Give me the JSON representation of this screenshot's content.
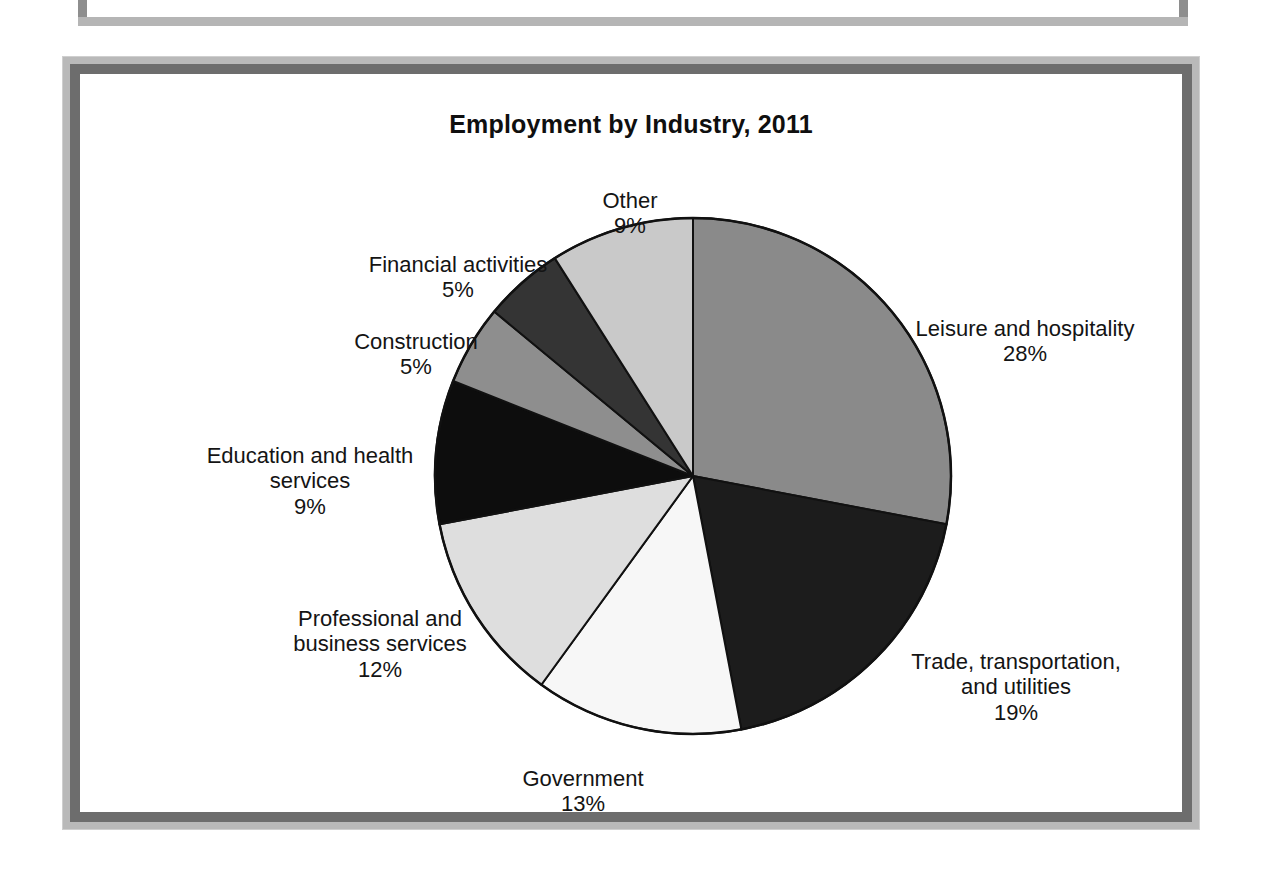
{
  "figure": {
    "title": "Employment by Industry, 2011"
  },
  "chart_data": {
    "type": "pie",
    "title": "Employment by Industry, 2011",
    "xlabel": "",
    "ylabel": "",
    "legend_position": "none",
    "grid": false,
    "value_unit": "percent",
    "start_angle_deg": 0,
    "direction": "clockwise",
    "categories": [
      "Leisure and hospitality",
      "Trade, transportation, and utilities",
      "Government",
      "Professional and business services",
      "Education and health services",
      "Construction",
      "Financial activities",
      "Other"
    ],
    "values": [
      28,
      19,
      13,
      12,
      9,
      5,
      5,
      9
    ],
    "slice_colors": [
      "#8a8a8a",
      "#1c1c1c",
      "#f7f7f7",
      "#dedede",
      "#0d0d0d",
      "#8e8e8e",
      "#343434",
      "#c9c9c9"
    ],
    "slices": [
      {
        "label": "Leisure and hospitality",
        "value": 28,
        "value_label": "28%",
        "color": "#8a8a8a"
      },
      {
        "label": "Trade, transportation, and utilities",
        "value": 19,
        "value_label": "19%",
        "color": "#1c1c1c"
      },
      {
        "label": "Government",
        "value": 13,
        "value_label": "13%",
        "color": "#f7f7f7"
      },
      {
        "label": "Professional and business services",
        "value": 12,
        "value_label": "12%",
        "color": "#dedede"
      },
      {
        "label": "Education and health services",
        "value": 9,
        "value_label": "9%",
        "color": "#0d0d0d"
      },
      {
        "label": "Construction",
        "value": 5,
        "value_label": "5%",
        "color": "#8e8e8e"
      },
      {
        "label": "Financial activities",
        "value": 5,
        "value_label": "5%",
        "color": "#343434"
      },
      {
        "label": "Other",
        "value": 9,
        "value_label": "9%",
        "color": "#c9c9c9"
      }
    ]
  },
  "labels": {
    "other": {
      "name": "Other",
      "pct": "9%"
    },
    "financial": {
      "name": "Financial activities",
      "pct": "5%"
    },
    "construction": {
      "name": "Construction",
      "pct": "5%"
    },
    "education": {
      "name": "Education and health\nservices",
      "pct": "9%"
    },
    "professional": {
      "name": "Professional and\nbusiness services",
      "pct": "12%"
    },
    "government": {
      "name": "Government",
      "pct": "13%"
    },
    "trade": {
      "name": "Trade, transportation,\nand utilities",
      "pct": "19%"
    },
    "leisure": {
      "name": "Leisure and hospitality",
      "pct": "28%"
    }
  }
}
